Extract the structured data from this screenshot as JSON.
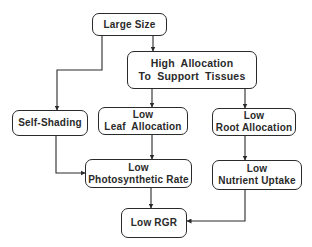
{
  "diagram": {
    "type": "flowchart",
    "nodes": {
      "large_size": {
        "lines": [
          "Large Size"
        ]
      },
      "high_allocation": {
        "lines": [
          "High  Allocation",
          "To  Support  Tissues"
        ]
      },
      "self_shading": {
        "lines": [
          "Self-Shading"
        ]
      },
      "low_leaf_allocation": {
        "lines": [
          "Low",
          "Leaf  Allocation"
        ]
      },
      "low_root_allocation": {
        "lines": [
          "Low",
          "Root Allocation"
        ]
      },
      "low_photosynthetic_rate": {
        "lines": [
          "Low",
          "Photosynthetic Rate"
        ]
      },
      "low_nutrient_uptake": {
        "lines": [
          "Low",
          "Nutrient Uptake"
        ]
      },
      "low_rgr": {
        "lines": [
          "Low RGR"
        ]
      }
    },
    "edges": [
      {
        "from": "large_size",
        "to": "high_allocation"
      },
      {
        "from": "large_size",
        "to": "self_shading"
      },
      {
        "from": "high_allocation",
        "to": "low_leaf_allocation"
      },
      {
        "from": "high_allocation",
        "to": "low_root_allocation"
      },
      {
        "from": "self_shading",
        "to": "low_photosynthetic_rate"
      },
      {
        "from": "low_leaf_allocation",
        "to": "low_photosynthetic_rate"
      },
      {
        "from": "low_root_allocation",
        "to": "low_nutrient_uptake"
      },
      {
        "from": "low_photosynthetic_rate",
        "to": "low_rgr"
      },
      {
        "from": "low_nutrient_uptake",
        "to": "low_rgr"
      }
    ],
    "colors": {
      "stroke": "#2a2a2a",
      "background": "#ffffff"
    }
  }
}
